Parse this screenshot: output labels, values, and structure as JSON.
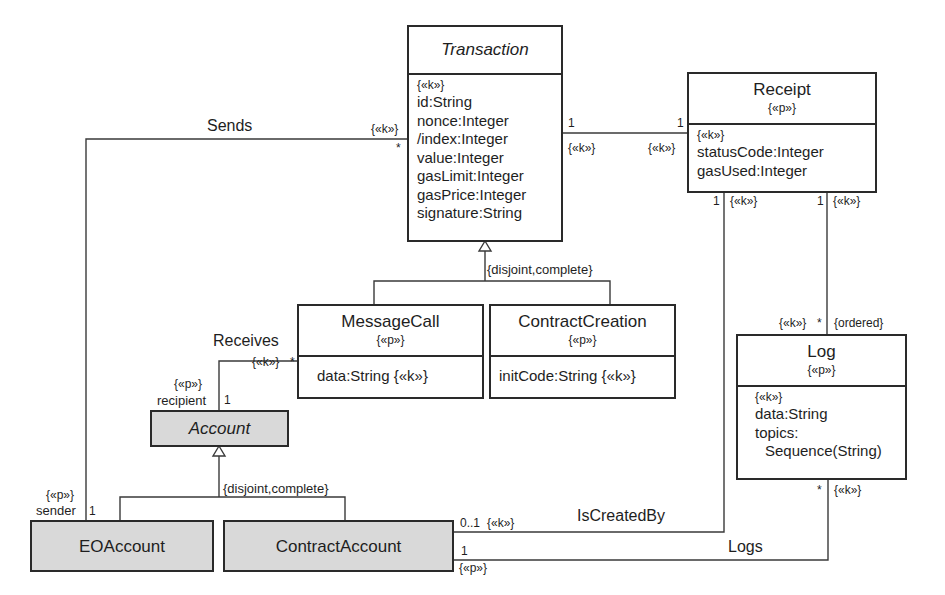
{
  "classes": {
    "transaction": {
      "name": "Transaction",
      "key_stereotype": "{«k»}",
      "attributes": [
        "id:String",
        "nonce:Integer",
        "/index:Integer",
        "value:Integer",
        "gasLimit:Integer",
        "gasPrice:Integer",
        "signature:String"
      ]
    },
    "receipt": {
      "name": "Receipt",
      "stereotype": "{«p»}",
      "key_stereotype": "{«k»}",
      "attributes": [
        "statusCode:Integer",
        "gasUsed:Integer"
      ]
    },
    "message_call": {
      "name": "MessageCall",
      "stereotype": "{«p»}",
      "attributes": [
        "data:String {«k»}"
      ]
    },
    "contract_creation": {
      "name": "ContractCreation",
      "stereotype": "{«p»}",
      "attributes": [
        "initCode:String {«k»}"
      ]
    },
    "log": {
      "name": "Log",
      "stereotype": "{«p»}",
      "key_stereotype": "{«k»}",
      "attributes": [
        "data:String",
        "topics:",
        "Sequence(String)"
      ]
    },
    "account": {
      "name": "Account"
    },
    "eo_account": {
      "name": "EOAccount"
    },
    "contract_account": {
      "name": "ContractAccount"
    }
  },
  "generalizations": {
    "transaction_constraint": "{disjoint,complete}",
    "account_constraint": "{disjoint,complete}"
  },
  "associations": {
    "sends": {
      "name": "Sends",
      "transaction_end": {
        "stereotype": "{«k»}",
        "multiplicity": "*"
      },
      "sender_end": {
        "stereotype": "{«p»}",
        "role": "sender",
        "multiplicity": "1"
      }
    },
    "receives": {
      "name": "Receives",
      "messagecall_end": {
        "stereotype": "{«k»}",
        "multiplicity": "*"
      },
      "recipient_end": {
        "stereotype": "{«p»}",
        "role": "recipient",
        "multiplicity": "1"
      }
    },
    "transaction_receipt": {
      "transaction_end": {
        "multiplicity": "1",
        "stereotype": "{«k»}"
      },
      "receipt_end": {
        "multiplicity": "1",
        "stereotype": "{«k»}"
      }
    },
    "is_created_by": {
      "name": "IsCreatedBy",
      "receipt_end": {
        "multiplicity": "1",
        "stereotype": "{«k»}"
      },
      "contract_account_end": {
        "multiplicity": "0..1",
        "stereotype": "{«k»}"
      }
    },
    "receipt_log": {
      "receipt_end": {
        "multiplicity": "1",
        "stereotype": "{«k»}"
      },
      "log_end": {
        "stereotype": "{«k»}",
        "multiplicity": "*",
        "constraint": "{ordered}"
      }
    },
    "logs": {
      "name": "Logs",
      "log_end": {
        "multiplicity": "*",
        "stereotype": "{«k»}"
      },
      "contract_account_end": {
        "multiplicity": "1",
        "stereotype": "{«p»}"
      }
    }
  }
}
